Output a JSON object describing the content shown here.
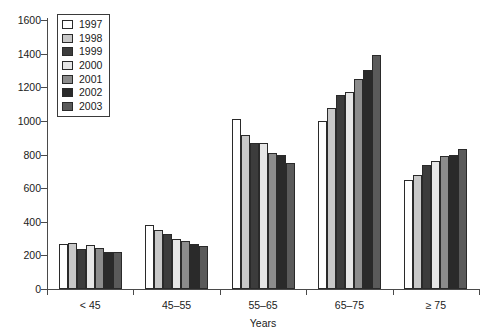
{
  "chart_data": {
    "type": "bar",
    "title": "",
    "xlabel": "Years",
    "ylabel": "",
    "categories": [
      "< 45",
      "45–55",
      "55–65",
      "65–75",
      "≥ 75"
    ],
    "ylim": [
      0,
      1600
    ],
    "yticks": [
      0,
      200,
      400,
      600,
      800,
      1000,
      1200,
      1400,
      1600
    ],
    "ytick_labels": [
      "0",
      "200",
      "400",
      "600",
      "800",
      "1000",
      "1200",
      "1400",
      "1600"
    ],
    "grid": false,
    "legend_position": "top-left",
    "series": [
      {
        "name": "1997",
        "color": "#ffffff",
        "values": [
          270,
          380,
          1010,
          1000,
          650
        ]
      },
      {
        "name": "1998",
        "color": "#c8c8c8",
        "values": [
          275,
          350,
          915,
          1075,
          680
        ]
      },
      {
        "name": "1999",
        "color": "#3c3c3c",
        "values": [
          240,
          330,
          870,
          1155,
          740
        ]
      },
      {
        "name": "2000",
        "color": "#e6e6e6",
        "values": [
          260,
          300,
          870,
          1170,
          760
        ]
      },
      {
        "name": "2001",
        "color": "#8c8c8c",
        "values": [
          245,
          285,
          810,
          1250,
          790
        ]
      },
      {
        "name": "2002",
        "color": "#2a2a2a",
        "values": [
          222,
          265,
          800,
          1300,
          800
        ]
      },
      {
        "name": "2003",
        "color": "#5a5a5a",
        "values": [
          220,
          258,
          750,
          1390,
          830
        ]
      }
    ]
  }
}
